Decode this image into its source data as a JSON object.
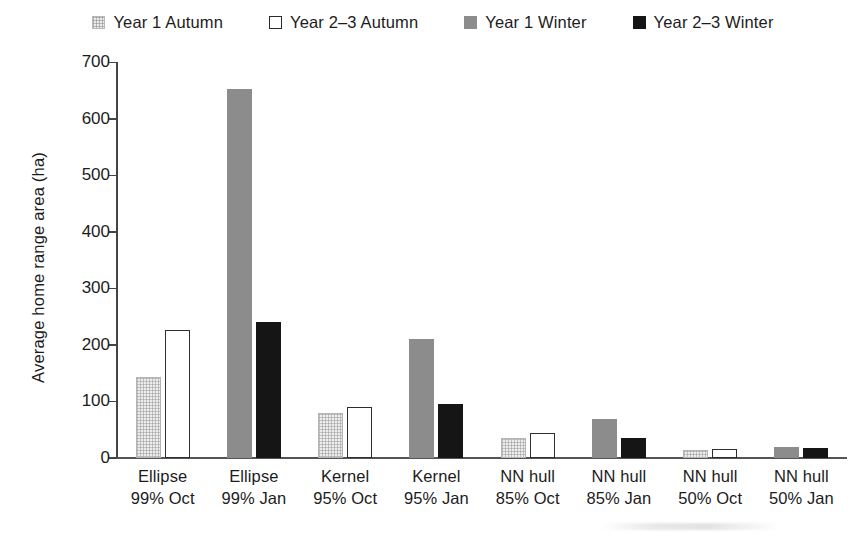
{
  "chart_data": {
    "type": "bar",
    "title": "",
    "xlabel": "",
    "ylabel": "Average home range area (ha)",
    "ylim": [
      0,
      700
    ],
    "ytick_labels": [
      "700",
      "600",
      "500",
      "400",
      "300",
      "200",
      "100",
      "0"
    ],
    "ytick_values": [
      700,
      600,
      500,
      400,
      300,
      200,
      100,
      0
    ],
    "grid": false,
    "legend_position": "top-center",
    "categories": [
      "Ellipse 99% Oct",
      "Ellipse 99% Jan",
      "Kernel 95% Oct",
      "Kernel 95% Jan",
      "NN hull 85% Oct",
      "NN hull 85% Jan",
      "NN hull 50% Oct",
      "NN hull 50% Jan"
    ],
    "category_lines": [
      [
        "Ellipse",
        "99% Oct"
      ],
      [
        "Ellipse",
        "99% Jan"
      ],
      [
        "Kernel",
        "95% Oct"
      ],
      [
        "Kernel",
        "95% Jan"
      ],
      [
        "NN hull",
        "85% Oct"
      ],
      [
        "NN hull",
        "85% Jan"
      ],
      [
        "NN hull",
        "50% Oct"
      ],
      [
        "NN hull",
        "50% Jan"
      ]
    ],
    "series": [
      {
        "name": "Year 1 Autumn",
        "key": "y1a",
        "color": "#ededed",
        "values": [
          143,
          null,
          79,
          null,
          35,
          null,
          14,
          null
        ]
      },
      {
        "name": "Year 2–3 Autumn",
        "key": "y23a",
        "color": "#ffffff",
        "values": [
          227,
          null,
          90,
          null,
          44,
          null,
          16,
          null
        ]
      },
      {
        "name": "Year 1 Winter",
        "key": "y1w",
        "color": "#8c8c8c",
        "values": [
          null,
          653,
          null,
          211,
          null,
          69,
          null,
          20
        ]
      },
      {
        "name": "Year 2–3 Winter",
        "key": "y23w",
        "color": "#151515",
        "values": [
          null,
          240,
          null,
          96,
          null,
          36,
          null,
          18
        ]
      }
    ]
  },
  "legend": {
    "items": [
      {
        "label": "Year 1 Autumn",
        "swatch": "y1a"
      },
      {
        "label": "Year 2–3 Autumn",
        "swatch": "y23a"
      },
      {
        "label": "Year 1 Winter",
        "swatch": "y1w"
      },
      {
        "label": "Year 2–3 Winter",
        "swatch": "y23w"
      }
    ]
  },
  "axis": {
    "y_title": "Average home range area (ha)"
  },
  "labels": {
    "y_700": "700",
    "y_600": "600",
    "y_500": "500",
    "y_400": "400",
    "y_300": "300",
    "y_200": "200",
    "y_100": "100",
    "y_0": "0",
    "legend_0": "Year 1 Autumn",
    "legend_1": "Year 2–3 Autumn",
    "legend_2": "Year 1 Winter",
    "legend_3": "Year 2–3 Winter",
    "x0_line1": "Ellipse",
    "x0_line2": "99% Oct",
    "x1_line1": "Ellipse",
    "x1_line2": "99% Jan",
    "x2_line1": "Kernel",
    "x2_line2": "95% Oct",
    "x3_line1": "Kernel",
    "x3_line2": "95% Jan",
    "x4_line1": "NN hull",
    "x4_line2": "85% Oct",
    "x5_line1": "NN hull",
    "x5_line2": "85% Jan",
    "x6_line1": "NN hull",
    "x6_line2": "50% Oct",
    "x7_line1": "NN hull",
    "x7_line2": "50% Jan"
  }
}
